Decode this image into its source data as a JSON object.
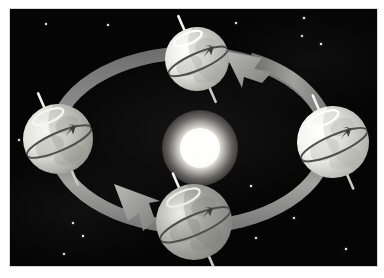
{
  "figure": {
    "title": "Earth's orbit around the Sun showing axial tilt and seasons",
    "type": "astronomy-diagram",
    "background_color": "#050505",
    "frame_color": "#ffffff",
    "width": 384,
    "height": 278
  },
  "sun": {
    "label": "Sun",
    "center": [
      190,
      139
    ],
    "core_radius": 20,
    "glow_radius": 38,
    "core_color": "#ffffff",
    "glow_color": "#cfcdc4"
  },
  "orbit": {
    "label": "Orbital path",
    "shape": "ellipse",
    "center": [
      190,
      139
    ],
    "radius_x": 138,
    "radius_y": 88,
    "band_width": 13,
    "band_color": "#8c8c8c",
    "band_color_highlight": "#b4b4b0",
    "band_color_shadow": "#565656",
    "direction": "counter-clockwise",
    "arrowheads": [
      {
        "name": "arrowhead-upper-right",
        "position": [
          247,
          57
        ],
        "points_toward": "top-earth"
      },
      {
        "name": "arrowhead-lower-left",
        "position": [
          132,
          219
        ],
        "points_toward": "bottom-earth"
      }
    ]
  },
  "earths": [
    {
      "id": "top",
      "label": "Earth at top of orbit",
      "season_hemisphere_note": "North pole tilted away from viewer side",
      "center": [
        196,
        58
      ],
      "radius": 32,
      "axis_tilt_degrees": 23.5,
      "body_color": "#e9e9e4",
      "shadow_color": "#9c9c97",
      "pole_cap_color": "#ffffff",
      "rotation_arrow": "eastward"
    },
    {
      "id": "left",
      "label": "Earth at left of orbit",
      "season_hemisphere_note": "North pole tilted left, terminator on right",
      "center": [
        57,
        138
      ],
      "radius": 35,
      "axis_tilt_degrees": 23.5,
      "body_color": "#e2e2dc",
      "shadow_color": "#8e8e89",
      "pole_cap_color": "#f6f6f2",
      "rotation_arrow": "eastward"
    },
    {
      "id": "right",
      "label": "Earth at right of orbit",
      "season_hemisphere_note": "Brightly lit, highlight facing Sun",
      "center": [
        332,
        141
      ],
      "radius": 36,
      "axis_tilt_degrees": 23.5,
      "body_color": "#f3f3ef",
      "shadow_color": "#a8a8a2",
      "pole_cap_color": "#ffffff",
      "rotation_arrow": "eastward"
    },
    {
      "id": "bottom",
      "label": "Earth at bottom of orbit",
      "season_hemisphere_note": "North pole tilted toward viewer, darker shading",
      "center": [
        193,
        221
      ],
      "radius": 38,
      "axis_tilt_degrees": 23.5,
      "body_color": "#b8b8b2",
      "shadow_color": "#7e7e79",
      "pole_cap_color": "#efefea",
      "rotation_arrow": "eastward"
    }
  ],
  "starfield": {
    "label": "Background stars",
    "count": 14,
    "star_color": "#ffffff",
    "stars": [
      {
        "x": 45,
        "y": 23,
        "r": 1.1
      },
      {
        "x": 107,
        "y": 24,
        "r": 0.9
      },
      {
        "x": 235,
        "y": 22,
        "r": 0.9
      },
      {
        "x": 303,
        "y": 17,
        "r": 0.8
      },
      {
        "x": 301,
        "y": 35,
        "r": 1.0
      },
      {
        "x": 320,
        "y": 43,
        "r": 0.8
      },
      {
        "x": 18,
        "y": 139,
        "r": 0.9
      },
      {
        "x": 72,
        "y": 222,
        "r": 1.0
      },
      {
        "x": 82,
        "y": 235,
        "r": 0.8
      },
      {
        "x": 63,
        "y": 253,
        "r": 0.9
      },
      {
        "x": 250,
        "y": 185,
        "r": 0.8
      },
      {
        "x": 255,
        "y": 237,
        "r": 0.9
      },
      {
        "x": 293,
        "y": 217,
        "r": 0.9
      },
      {
        "x": 345,
        "y": 248,
        "r": 0.8
      }
    ]
  }
}
